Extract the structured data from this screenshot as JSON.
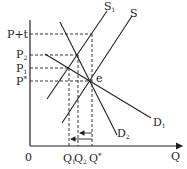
{
  "diagram": {
    "type": "supply-demand-tax",
    "axes": {
      "origin_label": "0",
      "x_label": "Q"
    },
    "price_labels": {
      "p_plus_t": "P+t",
      "p2": "P",
      "p2_sub": "2",
      "p1": "P",
      "p1_sub": "1",
      "p_star": "P",
      "p_star_sup": "*"
    },
    "quantity_labels": {
      "q1": "Q",
      "q1_sub": "1",
      "q2": "Q",
      "q2_sub": "2",
      "q_star": "Q",
      "q_star_sup": "*"
    },
    "curves": {
      "s1": "S",
      "s1_sub": "1",
      "s": "S",
      "d1": "D",
      "d1_sub": "1",
      "d2": "D",
      "d2_sub": "2"
    },
    "equilibrium_label": "e",
    "colors": {
      "line": "#222222",
      "background": "#ffffff"
    }
  }
}
